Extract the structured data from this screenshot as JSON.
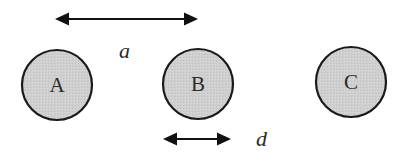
{
  "diagram": {
    "colors": {
      "circle_fill": "#cfcfcf",
      "circle_stroke": "#1a1a1a",
      "arrow": "#111111",
      "text": "#2a2a2a",
      "background": "#ffffff"
    },
    "circles": [
      {
        "id": "A",
        "label": "A",
        "cx": 57,
        "cy": 85,
        "r": 35
      },
      {
        "id": "B",
        "label": "B",
        "cx": 198,
        "cy": 84,
        "r": 35
      },
      {
        "id": "C",
        "label": "C",
        "cx": 351,
        "cy": 82,
        "r": 35
      }
    ],
    "arrows": [
      {
        "id": "spacing",
        "label": "a",
        "x1": 55,
        "x2": 198,
        "y": 19,
        "label_x": 119,
        "label_y": 58
      },
      {
        "id": "diameter",
        "label": "d",
        "x1": 163,
        "x2": 231,
        "y": 139,
        "label_x": 256,
        "label_y": 146
      }
    ]
  }
}
